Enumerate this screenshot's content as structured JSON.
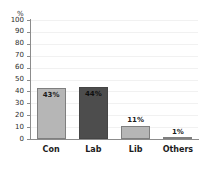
{
  "chart_data": {
    "type": "bar",
    "title": "",
    "subtitle": "",
    "xlabel": "",
    "ylabel": "%",
    "unit_label": "%",
    "categories": [
      "Con",
      "Lab",
      "Lib",
      "Others"
    ],
    "values": [
      43,
      44,
      11,
      1
    ],
    "data_labels": [
      "43%",
      "44%",
      "11%",
      "1%"
    ],
    "ylim": [
      0,
      100
    ],
    "y_ticks": [
      100,
      90,
      80,
      70,
      60,
      50,
      40,
      30,
      20,
      10,
      0
    ],
    "y_tick_labels": [
      "100",
      "90",
      "80",
      "70",
      "60",
      "50",
      "40",
      "30",
      "20",
      "10",
      "0"
    ],
    "grid": true,
    "legend": false,
    "legend_position": "none",
    "bar_colors": [
      "#b6b6b6",
      "#4d4d4d",
      "#b6b6b6",
      "#b6b6b6"
    ],
    "data_label_colors": [
      "#1c1c1c",
      "#1c1c1c",
      "#1c1c1c",
      "#1c1c1c"
    ],
    "data_label_positions": [
      "inside",
      "inside",
      "above",
      "above"
    ],
    "axis_color": "#8c8c8c",
    "grid_color": "#f1f1f1",
    "background_color": "#ffffff"
  },
  "axis": {
    "unit": "%",
    "ticks": [
      {
        "label": "100"
      },
      {
        "label": "90"
      },
      {
        "label": "80"
      },
      {
        "label": "70"
      },
      {
        "label": "60"
      },
      {
        "label": "50"
      },
      {
        "label": "40"
      },
      {
        "label": "30"
      },
      {
        "label": "20"
      },
      {
        "label": "10"
      },
      {
        "label": "0"
      }
    ]
  },
  "bars": [
    {
      "category": "Con",
      "value": 43,
      "label": "43%"
    },
    {
      "category": "Lab",
      "value": 44,
      "label": "44%"
    },
    {
      "category": "Lib",
      "value": 11,
      "label": "11%"
    },
    {
      "category": "Others",
      "value": 1,
      "label": "1%"
    }
  ]
}
